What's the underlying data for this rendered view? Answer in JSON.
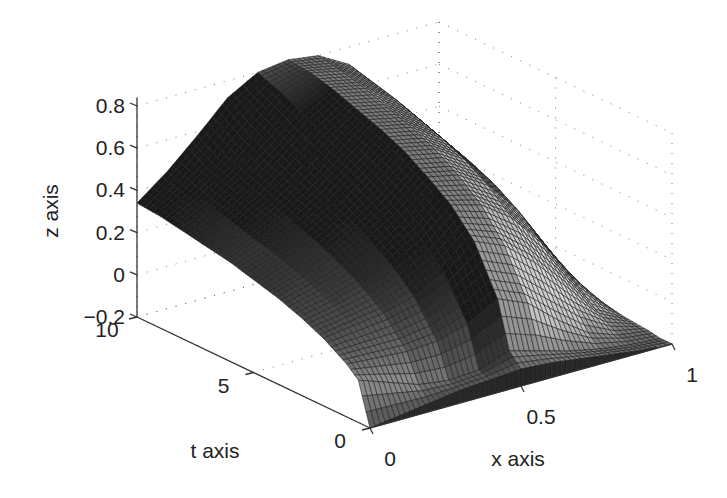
{
  "chart_data": {
    "type": "surface3d",
    "title": "",
    "xlabel": "x axis",
    "ylabel": "t axis",
    "zlabel": "z axis",
    "x_range": [
      0,
      1
    ],
    "t_range": [
      0,
      10
    ],
    "z_range": [
      -0.2,
      0.8
    ],
    "x_ticks": [
      "0",
      "0.5",
      "1"
    ],
    "t_ticks": [
      "0",
      "5",
      "10"
    ],
    "z_ticks": [
      "-0.2",
      "0",
      "0.2",
      "0.4",
      "0.6",
      "0.8"
    ],
    "grid": true,
    "colormap": "gray",
    "x": [
      0,
      0.1,
      0.2,
      0.3,
      0.4,
      0.5,
      0.6,
      0.7,
      0.8,
      0.9,
      1.0
    ],
    "t": [
      0,
      0.5,
      1,
      2,
      3,
      4,
      5,
      6,
      7,
      8,
      9,
      10
    ],
    "z": [
      [
        -0.2,
        -0.18,
        -0.16,
        -0.14,
        -0.13,
        -0.12,
        -0.13,
        -0.15,
        -0.17,
        -0.19,
        -0.2
      ],
      [
        0.0,
        -0.05,
        -0.1,
        -0.12,
        -0.11,
        -0.06,
        -0.1,
        -0.14,
        -0.17,
        -0.19,
        -0.2
      ],
      [
        0.05,
        0.04,
        0.03,
        0.04,
        0.08,
        0.16,
        0.1,
        -0.02,
        -0.12,
        -0.17,
        -0.19
      ],
      [
        0.12,
        0.14,
        0.16,
        0.2,
        0.27,
        0.38,
        0.32,
        0.2,
        0.05,
        -0.1,
        -0.18
      ],
      [
        0.17,
        0.2,
        0.24,
        0.3,
        0.38,
        0.5,
        0.46,
        0.36,
        0.2,
        0.0,
        -0.16
      ],
      [
        0.21,
        0.25,
        0.3,
        0.37,
        0.46,
        0.58,
        0.55,
        0.46,
        0.3,
        0.08,
        -0.14
      ],
      [
        0.24,
        0.29,
        0.35,
        0.43,
        0.53,
        0.65,
        0.62,
        0.53,
        0.37,
        0.14,
        -0.12
      ],
      [
        0.27,
        0.32,
        0.39,
        0.48,
        0.59,
        0.7,
        0.67,
        0.58,
        0.42,
        0.18,
        -0.11
      ],
      [
        0.29,
        0.35,
        0.43,
        0.53,
        0.64,
        0.74,
        0.71,
        0.62,
        0.46,
        0.22,
        -0.1
      ],
      [
        0.31,
        0.38,
        0.47,
        0.58,
        0.7,
        0.78,
        0.75,
        0.66,
        0.5,
        0.25,
        -0.09
      ],
      [
        0.33,
        0.41,
        0.51,
        0.64,
        0.76,
        0.81,
        0.78,
        0.69,
        0.53,
        0.28,
        -0.08
      ],
      [
        0.34,
        0.45,
        0.58,
        0.72,
        0.8,
        0.82,
        0.8,
        0.72,
        0.56,
        0.3,
        -0.07
      ]
    ]
  },
  "view": {
    "origin_px": [
      370,
      428
    ],
    "x_unit_px": [
      302,
      -84
    ],
    "t_unit_px": [
      -23.3,
      -11.1
    ],
    "z_unit_px": [
      0,
      -211
    ],
    "z_base": -0.2
  }
}
